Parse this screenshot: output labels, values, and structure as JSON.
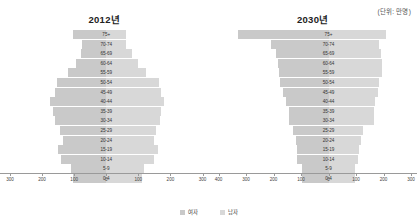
{
  "unit_note": "(단위: 만명)",
  "legend": {
    "items": [
      {
        "label": "여자",
        "color": "#c9c9c9",
        "key": "female"
      },
      {
        "label": "남자",
        "color": "#d8d8d8",
        "key": "male"
      }
    ]
  },
  "chart_data": [
    {
      "type": "bar",
      "title": "2012년",
      "subtype": "population-pyramid",
      "xlabel": "",
      "ylabel": "",
      "unit": "만명",
      "grid": false,
      "legend_position": "bottom-center",
      "categories": [
        "75+",
        "70-74",
        "65-69",
        "60-64",
        "55-59",
        "50-54",
        "45-49",
        "40-44",
        "35-39",
        "30-34",
        "25-29",
        "20-24",
        "15-19",
        "10-14",
        "5-9",
        "0-4"
      ],
      "axis_ticks_left": [
        300,
        200,
        100,
        0
      ],
      "axis_ticks_right": [
        100,
        200,
        300
      ],
      "xlim": [
        -300,
        300
      ],
      "series": [
        {
          "name": "여자",
          "side": "left",
          "values": [
            105,
            75,
            80,
            95,
            120,
            155,
            160,
            175,
            165,
            160,
            145,
            135,
            150,
            140,
            110,
            105
          ]
        },
        {
          "name": "남자",
          "side": "right",
          "values": [
            60,
            60,
            80,
            100,
            125,
            165,
            170,
            180,
            172,
            168,
            155,
            150,
            160,
            148,
            118,
            110
          ]
        }
      ]
    },
    {
      "type": "bar",
      "title": "2030년",
      "subtype": "population-pyramid",
      "xlabel": "",
      "ylabel": "",
      "unit": "만명",
      "grid": false,
      "legend_position": "bottom-center",
      "categories": [
        "75+",
        "70-74",
        "65-69",
        "60-64",
        "55-59",
        "50-54",
        "45-49",
        "40-44",
        "35-39",
        "30-34",
        "25-29",
        "20-24",
        "15-19",
        "10-14",
        "5-9",
        "0-4"
      ],
      "axis_ticks_left": [
        400,
        300,
        200,
        100,
        0
      ],
      "axis_ticks_right": [
        100,
        200,
        300
      ],
      "xlim": [
        -400,
        300
      ],
      "series": [
        {
          "name": "여자",
          "side": "left",
          "values": [
            330,
            210,
            190,
            185,
            180,
            175,
            165,
            155,
            145,
            145,
            130,
            120,
            115,
            115,
            95,
            95
          ]
        },
        {
          "name": "남자",
          "side": "right",
          "values": [
            210,
            185,
            190,
            195,
            195,
            185,
            180,
            170,
            165,
            165,
            125,
            118,
            110,
            108,
            98,
            98
          ]
        }
      ]
    }
  ]
}
